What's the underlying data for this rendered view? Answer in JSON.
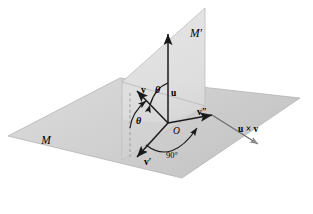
{
  "figure": {
    "background": "#ffffff"
  },
  "colors": {
    "plane_m_front": "#d0d0d0",
    "plane_m_back": "#bdbdbd",
    "plane_mprime": "#e0e0e0",
    "plane_mprime_lower": "#cacaca",
    "plane_edge": "#b0b0b0",
    "vector": "#1a1a1a",
    "arc": "#1a1a1a",
    "dashed": "#9a9a9a",
    "label": "#000000"
  },
  "labels": {
    "plane_m": "M",
    "plane_mprime": "M′",
    "origin": "O",
    "vector_u": "u",
    "vector_v": "v",
    "vector_v_prime": "v′",
    "vector_v_double_prime": "v″",
    "cross_product": "u × v",
    "theta_upper": "θ",
    "theta_lower": "θ",
    "right_angle": "90°"
  },
  "geometry": {
    "origin_px": [
      168,
      123
    ],
    "vector_u_tip_px": [
      168,
      30
    ],
    "vector_v_tip_px": [
      136,
      92
    ],
    "vector_v_prime_tip_px": [
      136,
      158
    ],
    "vector_v_double_prime_tip_px": [
      215,
      116
    ],
    "cross_product_tip_px": [
      258,
      145
    ],
    "plane_m_corners_px": [
      [
        8,
        136
      ],
      [
        120,
        78
      ],
      [
        300,
        98
      ],
      [
        182,
        178
      ]
    ],
    "plane_mprime_corners_px": [
      [
        205,
        8
      ],
      [
        205,
        106
      ],
      [
        122,
        160
      ],
      [
        122,
        82
      ]
    ]
  }
}
